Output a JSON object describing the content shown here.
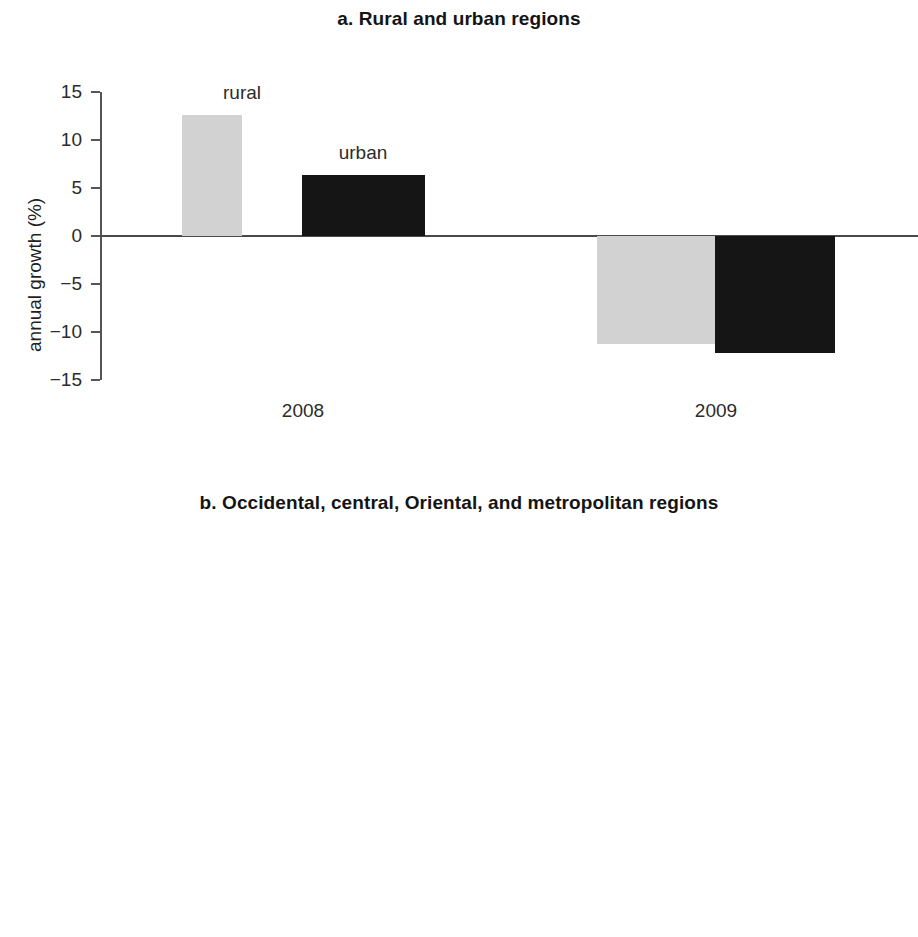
{
  "figure": {
    "panels": [
      {
        "key": "a",
        "title": "a. Rural and urban regions",
        "ylabel": "annual growth (%)",
        "yticks": [
          "15",
          "10",
          "5",
          "0",
          "−5",
          "−10",
          "−15"
        ],
        "groups": [
          "2008",
          "2009"
        ],
        "series_labels": [
          "rural",
          "urban"
        ]
      },
      {
        "key": "b",
        "title": "b. Occidental, central, Oriental, and metropolitan regions",
        "ylabel": "annual growth (%)",
        "yticks": [
          "20",
          "15",
          "10",
          "5",
          "0",
          "−5",
          "−10",
          "−15",
          "−20"
        ],
        "groups": [
          "2008",
          "2009"
        ],
        "series_labels": [
          "Occidental",
          "central\n1",
          "central\n2",
          "Oriental",
          "metro\nSan\nSalvador"
        ]
      }
    ]
  },
  "chart_data": [
    {
      "type": "bar",
      "title": "a. Rural and urban regions",
      "xlabel": "",
      "ylabel": "annual growth (%)",
      "ylim": [
        -15,
        15
      ],
      "ytick_step": 5,
      "grid": false,
      "legend": "inline bar labels",
      "categories": [
        "2008",
        "2009"
      ],
      "series": [
        {
          "name": "rural",
          "color": "#d2d2d2",
          "values": [
            12.6,
            -11.3
          ]
        },
        {
          "name": "urban",
          "color": "#151515",
          "values": [
            6.4,
            -12.2
          ]
        }
      ]
    },
    {
      "type": "bar",
      "title": "b. Occidental, central, Oriental, and metropolitan regions",
      "xlabel": "",
      "ylabel": "annual growth (%)",
      "ylim": [
        -20,
        20
      ],
      "ytick_step": 5,
      "grid": false,
      "legend": "inline bar labels",
      "categories": [
        "2008",
        "2009"
      ],
      "series": [
        {
          "name": "Occidental",
          "color": "#f4f4f4",
          "values": [
            0.3,
            -4.0
          ]
        },
        {
          "name": "central 1",
          "color": "#dcdcdc",
          "values": [
            13.9,
            -9.1
          ]
        },
        {
          "name": "central 2",
          "color": "#b2b2b2",
          "values": [
            13.6,
            -15.4
          ]
        },
        {
          "name": "Oriental",
          "color": "#7d7d7d",
          "values": [
            4.8,
            -5.6
          ]
        },
        {
          "name": "metro San Salvador",
          "color": "#151515",
          "values": [
            18.8,
            -14.8
          ]
        }
      ]
    }
  ]
}
